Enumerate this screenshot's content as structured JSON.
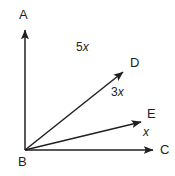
{
  "figure": {
    "stroke_color": "#231f20",
    "background_color": "#ffffff",
    "vertex": {
      "name": "B",
      "x": 25,
      "y": 150
    },
    "points": [
      {
        "id": "A",
        "label": "A",
        "label_x": 19,
        "label_y": 8,
        "ray_end_x": 25,
        "ray_end_y": 25
      },
      {
        "id": "B",
        "label": "B",
        "label_x": 18,
        "label_y": 155,
        "ray_end_x": 25,
        "ray_end_y": 150
      },
      {
        "id": "C",
        "label": "C",
        "label_x": 160,
        "label_y": 143,
        "ray_end_x": 157,
        "ray_end_y": 150
      },
      {
        "id": "D",
        "label": "D",
        "label_x": 130,
        "label_y": 56,
        "ray_end_x": 127,
        "ray_end_y": 68
      },
      {
        "id": "E",
        "label": "E",
        "label_x": 147,
        "label_y": 107,
        "ray_end_x": 145,
        "ray_end_y": 119
      }
    ],
    "angle_labels": [
      {
        "id": "angle-ABD",
        "coefficient": "5",
        "variable": "x",
        "text": "5x",
        "x": 76,
        "y": 41
      },
      {
        "id": "angle-DBE",
        "coefficient": "3",
        "variable": "x",
        "text": "3x",
        "x": 111,
        "y": 86
      },
      {
        "id": "angle-EBC",
        "coefficient": "",
        "variable": "x",
        "text": "x",
        "x": 143,
        "y": 126
      }
    ],
    "rays": [
      {
        "id": "ray-BA",
        "from": "B",
        "to": "A",
        "arrowhead": true
      },
      {
        "id": "ray-BD",
        "from": "B",
        "to": "D",
        "arrowhead": true
      },
      {
        "id": "ray-BE",
        "from": "B",
        "to": "E",
        "arrowhead": true
      },
      {
        "id": "ray-BC",
        "from": "B",
        "to": "C",
        "arrowhead": true
      }
    ]
  }
}
